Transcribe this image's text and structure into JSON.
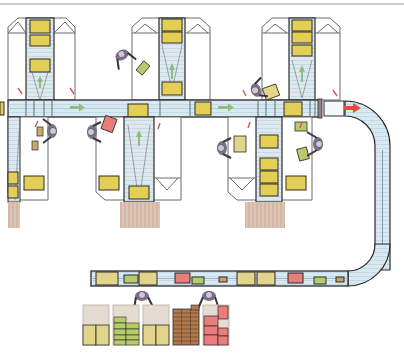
{
  "diagram": {
    "type": "warehouse-order-picking-layout",
    "caption": "",
    "colors": {
      "background": "#ffffff",
      "outline": "#2e2a2a",
      "frame_line": "#6b6b6b",
      "conveyor_fill": "#d8e9f2",
      "conveyor_stripe": "#a9c7d8",
      "tote_yellow": "#e3cf55",
      "tote_yellow_light": "#e2d48a",
      "tote_green": "#b6cc6a",
      "tote_pink": "#ea7c7c",
      "tote_brown": "#b07a4e",
      "pallet": "#dcc3b4",
      "pallet_line": "#b89a88",
      "flow_arrow_green": "#8bbd82",
      "flow_arrow_red": "#e14b3c",
      "small_red_arrow": "#d9534f",
      "worker": "#7e7088",
      "worker_head": "#cfc6d6"
    },
    "legend": [],
    "stations": [
      {
        "id": "station-1",
        "x": 10,
        "label": ""
      },
      {
        "id": "station-2",
        "x": 130,
        "label": ""
      },
      {
        "id": "station-3",
        "x": 260,
        "label": ""
      }
    ],
    "main_conveyor": {
      "direction": "right",
      "arrow_count": 3
    },
    "return_conveyor": {
      "direction": "left-to-pack",
      "items": [
        "yellow",
        "green",
        "yellow",
        "pink",
        "green",
        "brown",
        "yellow",
        "yellow",
        "pink",
        "green",
        "brown"
      ]
    },
    "pack_pallets": [
      {
        "id": "pallet-yellow-1",
        "color": "yellow"
      },
      {
        "id": "pallet-green",
        "color": "green"
      },
      {
        "id": "pallet-yellow-2",
        "color": "yellow"
      },
      {
        "id": "pallet-brown",
        "color": "brown"
      },
      {
        "id": "pallet-pink",
        "color": "pink"
      }
    ],
    "workers_count": 8
  }
}
